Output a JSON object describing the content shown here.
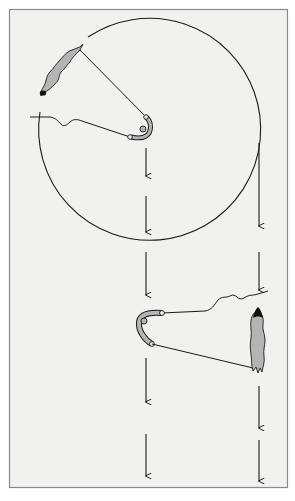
{
  "figure": {
    "type": "line-illustration",
    "labels": [],
    "colors": {
      "background": "#ffffff",
      "panel": "#f1f1f0",
      "frame": "#8a8a8a",
      "ink": "#1a1a1a",
      "fill": "#b4b4b4"
    },
    "panel": {
      "x": 9,
      "y": 9,
      "w": 279,
      "h": 479
    },
    "circle": {
      "cx": 148,
      "cy": 133,
      "r": 111
    },
    "upper_organism": {
      "description": "elongated gray body at top-left of circle, dark tip at lower end"
    },
    "lower_organism": {
      "description": "vertical elongated gray body at right, dark tip at top"
    },
    "hooks": [
      {
        "position": "upper",
        "x": 140,
        "y": 128
      },
      {
        "position": "lower",
        "x": 148,
        "y": 328
      }
    ],
    "arrow_columns": [
      {
        "x": 146,
        "arrows": [
          [
            148,
            176
          ],
          [
            196,
            232
          ],
          [
            252,
            295
          ],
          [
            358,
            402
          ],
          [
            434,
            476
          ]
        ]
      },
      {
        "x": 259,
        "arrows": [
          [
            150,
            226
          ],
          [
            252,
            290
          ],
          [
            386,
            428
          ],
          [
            440,
            481
          ]
        ]
      }
    ]
  }
}
